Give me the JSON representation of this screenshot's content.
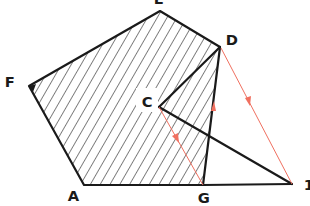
{
  "diagram": {
    "type": "geometry-construction",
    "colors": {
      "stroke": "#1a1a1a",
      "hatch": "#1a1a1a",
      "construction": "#f07060",
      "background": "#ffffff"
    },
    "points": {
      "A": {
        "label": "A",
        "x": 84,
        "y": 185
      },
      "F": {
        "label": "F",
        "x": 29,
        "y": 86
      },
      "E": {
        "label": "E",
        "x": 160,
        "y": 11
      },
      "D": {
        "label": "D",
        "x": 220,
        "y": 47
      },
      "C": {
        "label": "C",
        "x": 159,
        "y": 107
      },
      "G": {
        "label": "G",
        "x": 203,
        "y": 185
      },
      "H": {
        "label": "1",
        "x": 292,
        "y": 184
      }
    },
    "hatched_polygon": [
      "A",
      "F",
      "E",
      "D",
      "G"
    ],
    "black_segments": [
      [
        "A",
        "F"
      ],
      [
        "F",
        "E"
      ],
      [
        "E",
        "D"
      ],
      [
        "D",
        "G"
      ],
      [
        "G",
        "A"
      ],
      [
        "D",
        "C"
      ],
      [
        "C",
        "H"
      ],
      [
        "G",
        "H"
      ]
    ],
    "red_vectors": [
      {
        "from": "D",
        "to": "H"
      },
      {
        "from": "C",
        "to": "G"
      }
    ],
    "red_arrow_on_DG": {
      "direction": "up",
      "from": "G",
      "to": "D"
    },
    "labels": {
      "E": "E",
      "D": "D",
      "F": "F",
      "C": "C",
      "A": "A",
      "G": "G",
      "H": "1"
    }
  }
}
